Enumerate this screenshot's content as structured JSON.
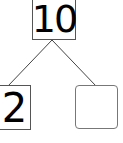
{
  "number_bond": {
    "whole": "10",
    "parts": [
      "2",
      ""
    ]
  }
}
